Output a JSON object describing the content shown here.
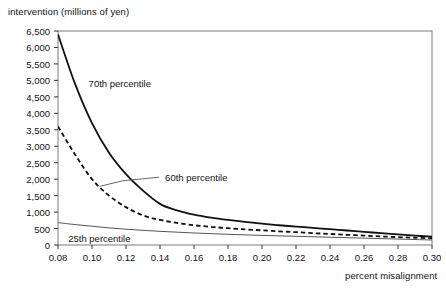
{
  "chart_data": {
    "type": "line",
    "title": "",
    "xlabel": "percent misalignment",
    "ylabel": "intervention (millions of yen)",
    "xlim": [
      0.08,
      0.3
    ],
    "ylim": [
      0,
      6500
    ],
    "grid": false,
    "legend_position": "inline-annotations",
    "xticks": [
      "0.08",
      "0.10",
      "0.12",
      "0.14",
      "0.16",
      "0.18",
      "0.20",
      "0.22",
      "0.24",
      "0.26",
      "0.28",
      "0.30"
    ],
    "xtick_values": [
      0.08,
      0.1,
      0.12,
      0.14,
      0.16,
      0.18,
      0.2,
      0.22,
      0.24,
      0.26,
      0.28,
      0.3
    ],
    "yticks": [
      "0",
      "500",
      "1,000",
      "1,500",
      "2,000",
      "2,500",
      "3,000",
      "3,500",
      "4,000",
      "4,500",
      "5,000",
      "5,500",
      "6,000",
      "6,500"
    ],
    "ytick_values": [
      0,
      500,
      1000,
      1500,
      2000,
      2500,
      3000,
      3500,
      4000,
      4500,
      5000,
      5500,
      6000,
      6500
    ],
    "x": [
      0.08,
      0.09,
      0.1,
      0.11,
      0.12,
      0.13,
      0.14,
      0.15,
      0.16,
      0.17,
      0.18,
      0.19,
      0.2,
      0.21,
      0.22,
      0.23,
      0.24,
      0.25,
      0.26,
      0.27,
      0.28,
      0.29,
      0.3
    ],
    "series": [
      {
        "name": "70th percentile",
        "style": "solid",
        "width": 1.8,
        "color": "#111111",
        "values": [
          6400,
          4900,
          3700,
          2800,
          2150,
          1650,
          1250,
          1050,
          920,
          830,
          760,
          700,
          650,
          600,
          560,
          520,
          480,
          440,
          400,
          360,
          320,
          285,
          255
        ]
      },
      {
        "name": "60th percentile",
        "style": "dashed",
        "width": 1.8,
        "color": "#111111",
        "values": [
          3600,
          2750,
          2000,
          1500,
          1150,
          900,
          760,
          670,
          600,
          550,
          510,
          475,
          445,
          415,
          390,
          360,
          335,
          310,
          285,
          260,
          240,
          220,
          205
        ]
      },
      {
        "name": "25th percentile",
        "style": "solid",
        "width": 1.0,
        "color": "#555555",
        "values": [
          680,
          620,
          570,
          520,
          480,
          445,
          415,
          390,
          365,
          345,
          325,
          308,
          292,
          278,
          264,
          250,
          236,
          222,
          208,
          194,
          180,
          166,
          152
        ]
      }
    ],
    "annotations": [
      {
        "text": "70th percentile",
        "x": 0.098,
        "y": 4900
      },
      {
        "text": "60th percentile",
        "x": 0.143,
        "y": 2050,
        "leader": true
      },
      {
        "text": "25th percentile",
        "x": 0.086,
        "y": 175
      }
    ]
  },
  "axis": {
    "ylabel": "intervention (millions of yen)",
    "xlabel": "percent misalignment"
  }
}
